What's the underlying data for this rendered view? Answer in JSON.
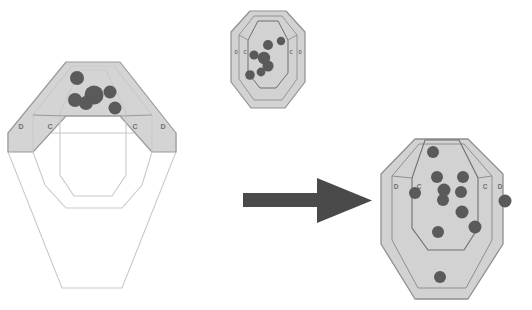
{
  "scene": {
    "title": "IPSC shooting target hit-pattern comparison",
    "background_color": "#ffffff",
    "arrow": {
      "name": "transition-arrow",
      "color": "#4a4a4a",
      "direction": "right",
      "shaft": {
        "x": 243,
        "y": 193,
        "width": 78,
        "height": 14
      },
      "head": {
        "tip_x": 372,
        "top_y": 178,
        "bottom_y": 223,
        "back_x": 317
      }
    }
  },
  "targets": [
    {
      "id": "target-left-closeup",
      "name": "target-left-closeup",
      "label": "Large close-up target (upper A/C/D zones shaded)",
      "zone_labels": [
        "D",
        "C",
        "C",
        "D"
      ],
      "fill_upper": "#d4d4d4",
      "fill_lower": "#ffffff",
      "outline": "#9a9a9a",
      "hole_color": "#5a5a5a",
      "hole_count": 6,
      "holes": [
        {
          "cx": 77,
          "cy": 78,
          "r": 7.0
        },
        {
          "cx": 94,
          "cy": 95,
          "r": 9.5
        },
        {
          "cx": 75,
          "cy": 100,
          "r": 7.0
        },
        {
          "cx": 86,
          "cy": 103,
          "r": 7.0
        },
        {
          "cx": 110,
          "cy": 92,
          "r": 6.5
        },
        {
          "cx": 115,
          "cy": 108,
          "r": 6.5
        }
      ]
    },
    {
      "id": "target-middle-small",
      "name": "target-middle-small",
      "label": "Small reference target with tight group",
      "zone_labels": [
        "D",
        "C",
        "C",
        "D"
      ],
      "fill_upper": "#d2d2d2",
      "fill_lower": "#d2d2d2",
      "outline": "#8f8f8f",
      "hole_color": "#5a5a5a",
      "hole_count": 7,
      "holes": [
        {
          "cx": 268,
          "cy": 45,
          "r": 5.0
        },
        {
          "cx": 281,
          "cy": 41,
          "r": 4.2
        },
        {
          "cx": 254,
          "cy": 55,
          "r": 4.6
        },
        {
          "cx": 264,
          "cy": 58,
          "r": 6.2
        },
        {
          "cx": 268,
          "cy": 66,
          "r": 5.6
        },
        {
          "cx": 261,
          "cy": 72,
          "r": 4.4
        },
        {
          "cx": 250,
          "cy": 75,
          "r": 4.8
        }
      ]
    },
    {
      "id": "target-right-result",
      "name": "target-right-result",
      "label": "Result target with dispersed hits",
      "zone_labels": [
        "D",
        "C",
        "C",
        "D"
      ],
      "fill_upper": "#d2d2d2",
      "fill_lower": "#d2d2d2",
      "outline": "#8f8f8f",
      "hole_color": "#5a5a5a",
      "hole_count": 11,
      "holes": [
        {
          "cx": 433,
          "cy": 152,
          "r": 6.0
        },
        {
          "cx": 437,
          "cy": 177,
          "r": 6.0
        },
        {
          "cx": 463,
          "cy": 177,
          "r": 6.0
        },
        {
          "cx": 415,
          "cy": 193,
          "r": 6.0
        },
        {
          "cx": 444,
          "cy": 190,
          "r": 6.5
        },
        {
          "cx": 443,
          "cy": 200,
          "r": 6.0
        },
        {
          "cx": 461,
          "cy": 192,
          "r": 6.0
        },
        {
          "cx": 462,
          "cy": 212,
          "r": 6.5
        },
        {
          "cx": 475,
          "cy": 227,
          "r": 6.5
        },
        {
          "cx": 438,
          "cy": 232,
          "r": 6.0
        },
        {
          "cx": 505,
          "cy": 201,
          "r": 6.5
        },
        {
          "cx": 440,
          "cy": 277,
          "r": 6.0
        }
      ]
    }
  ]
}
